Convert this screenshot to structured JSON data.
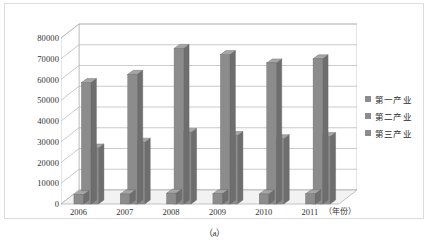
{
  "figure": {
    "caption": "（a）"
  },
  "chart_data": {
    "type": "bar",
    "title": "",
    "subtitle": "",
    "xlabel": "（年份）",
    "ylabel": "",
    "categories": [
      "2006",
      "2007",
      "2008",
      "2009",
      "2010",
      "2011"
    ],
    "series": [
      {
        "name": "第一产业",
        "color": "#8c8c8c",
        "values": [
          4500,
          4800,
          5200,
          5000,
          4800,
          4900
        ]
      },
      {
        "name": "第二产业",
        "color": "#8c8c8c",
        "values": [
          58500,
          62500,
          75000,
          72000,
          68000,
          70000
        ]
      },
      {
        "name": "第三产业",
        "color": "#8c8c8c",
        "values": [
          27000,
          29800,
          34500,
          33000,
          31500,
          32500
        ]
      }
    ],
    "ylim": [
      0,
      80000
    ],
    "ytick_labels": [
      "0",
      "10000",
      "20000",
      "30000",
      "40000",
      "50000",
      "60000",
      "70000",
      "80000"
    ],
    "ytick_values": [
      0,
      10000,
      20000,
      30000,
      40000,
      50000,
      60000,
      70000,
      80000
    ],
    "grid": true,
    "legend_position": "right",
    "style": "3d-column",
    "colors": {
      "bar_face": "#8c8c8c",
      "bar_side": "#6e6e6e",
      "bar_top": "#a6a6a6",
      "gridline": "#b5b5b5",
      "wall": "#ffffff",
      "floor": "#f2f2f2",
      "frame": "#dcdcdc",
      "text": "#333333"
    }
  }
}
